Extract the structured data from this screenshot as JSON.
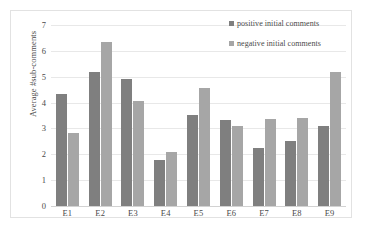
{
  "chart_data": {
    "type": "bar",
    "title": "",
    "xlabel": "",
    "ylabel": "Average #sub-comments",
    "ylim": [
      0,
      7
    ],
    "ytick_labels": [
      "7",
      "6",
      "5",
      "4",
      "3",
      "2",
      "1",
      "0"
    ],
    "ytick_values": [
      7,
      6,
      5,
      4,
      3,
      2,
      1,
      0
    ],
    "grid": true,
    "legend_position": "top-right",
    "categories": [
      "E1",
      "E2",
      "E3",
      "E4",
      "E5",
      "E6",
      "E7",
      "E8",
      "E9"
    ],
    "series": [
      {
        "name": "positive initial comments",
        "color": "#7f7f7f",
        "values": [
          4.33,
          5.2,
          4.92,
          1.78,
          3.52,
          3.33,
          2.25,
          2.5,
          3.08
        ]
      },
      {
        "name": "negative initial comments",
        "color": "#a6a6a6",
        "values": [
          2.83,
          6.33,
          4.08,
          2.07,
          4.58,
          3.08,
          3.37,
          3.42,
          5.2
        ]
      }
    ]
  },
  "legend": {
    "items": [
      {
        "label": "positive initial comments",
        "swatch": "legend-swatch-positive"
      },
      {
        "label": "negative initial comments",
        "swatch": "legend-swatch-negative"
      }
    ]
  },
  "colors": {
    "series_positive": "#7f7f7f",
    "series_negative": "#a6a6a6",
    "gridline": "#e8e8e8",
    "axis": "#d2d2d2",
    "border": "#e2e2e2",
    "text": "#4a4a4a"
  }
}
